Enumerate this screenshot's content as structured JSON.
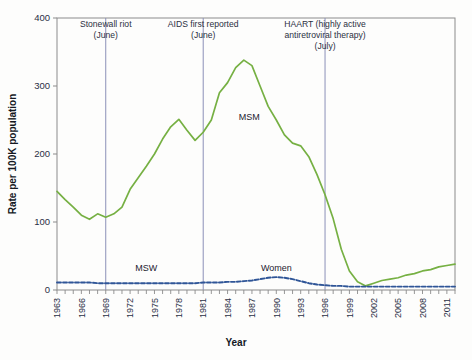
{
  "chart_data": {
    "type": "line",
    "title": "",
    "xlabel": "Year",
    "ylabel": "Rate per 100K population",
    "xlim": [
      1963,
      2012
    ],
    "ylim": [
      0,
      400
    ],
    "yticks": [
      0,
      100,
      200,
      300,
      400
    ],
    "xticks": [
      1963,
      1966,
      1969,
      1972,
      1975,
      1978,
      1981,
      1984,
      1987,
      1990,
      1993,
      1996,
      1999,
      2002,
      2005,
      2008,
      2011
    ],
    "xtick_all_years": [
      1963,
      1964,
      1965,
      1966,
      1967,
      1968,
      1969,
      1970,
      1971,
      1972,
      1973,
      1974,
      1975,
      1976,
      1977,
      1978,
      1979,
      1980,
      1981,
      1982,
      1983,
      1984,
      1985,
      1986,
      1987,
      1988,
      1989,
      1990,
      1991,
      1992,
      1993,
      1994,
      1995,
      1996,
      1997,
      1998,
      1999,
      2000,
      2001,
      2002,
      2003,
      2004,
      2005,
      2006,
      2007,
      2008,
      2009,
      2010,
      2011,
      2012
    ],
    "grid": false,
    "legend_position": "inline-annotations",
    "series": [
      {
        "name": "MSM",
        "color": "#76b043",
        "style": "solid",
        "label_x": 1985,
        "label_y": 250,
        "x": [
          1963,
          1964,
          1965,
          1966,
          1967,
          1968,
          1969,
          1970,
          1971,
          1972,
          1973,
          1974,
          1975,
          1976,
          1977,
          1978,
          1979,
          1980,
          1981,
          1982,
          1983,
          1984,
          1985,
          1986,
          1987,
          1988,
          1989,
          1990,
          1991,
          1992,
          1993,
          1994,
          1995,
          1996,
          1997,
          1998,
          1999,
          2000,
          2001,
          2002,
          2003,
          2004,
          2005,
          2006,
          2007,
          2008,
          2009,
          2010,
          2011,
          2012
        ],
        "values": [
          145,
          133,
          122,
          110,
          104,
          112,
          107,
          112,
          122,
          148,
          165,
          182,
          200,
          222,
          240,
          251,
          235,
          220,
          232,
          250,
          290,
          305,
          327,
          338,
          330,
          300,
          270,
          250,
          228,
          216,
          212,
          196,
          170,
          140,
          105,
          60,
          28,
          12,
          6,
          10,
          14,
          16,
          18,
          22,
          24,
          28,
          30,
          34,
          36,
          38
        ]
      },
      {
        "name": "MSW",
        "color": "#2f5597",
        "style": "dashed",
        "label_x": 1974,
        "label_y": 28,
        "x": [
          1963,
          1964,
          1965,
          1966,
          1967,
          1968,
          1969,
          1970,
          1971,
          1972,
          1973,
          1974,
          1975,
          1976,
          1977,
          1978,
          1979,
          1980,
          1981,
          1982,
          1983,
          1984,
          1985,
          1986,
          1987,
          1988,
          1989,
          1990,
          1991,
          1992,
          1993,
          1994,
          1995,
          1996,
          1997,
          1998,
          1999,
          2000,
          2001,
          2002,
          2003,
          2004,
          2005,
          2006,
          2007,
          2008,
          2009,
          2010,
          2011,
          2012
        ],
        "values": [
          11,
          11,
          11,
          11,
          11,
          10,
          10,
          10,
          10,
          10,
          10,
          10,
          10,
          10,
          10,
          10,
          10,
          10,
          11,
          11,
          11,
          12,
          12,
          13,
          14,
          16,
          18,
          19,
          18,
          16,
          13,
          10,
          8,
          7,
          6,
          6,
          5,
          5,
          5,
          5,
          5,
          5,
          5,
          5,
          5,
          5,
          5,
          5,
          5,
          5
        ]
      }
    ],
    "annotations": [
      {
        "label_lines": [
          "Stonewall riot",
          "(June)"
        ],
        "year": 1969,
        "line_top": 400,
        "line_bottom": 0
      },
      {
        "label_lines": [
          "AIDS first reported",
          "(June)"
        ],
        "year": 1981,
        "line_top": 400,
        "line_bottom": 0
      },
      {
        "label_lines": [
          "HAART (highly active",
          "antiretroviral therapy)",
          "(July)"
        ],
        "year": 1996,
        "line_top": 400,
        "line_bottom": 0
      }
    ],
    "series_inline_labels": [
      {
        "text": "MSM"
      },
      {
        "text": "MSW"
      },
      {
        "text": "Women"
      }
    ],
    "colors": {
      "msm_line": "#76b043",
      "msw_line": "#2f5597",
      "annotation_line": "#8b90b8",
      "axis": "#8b8b8b",
      "text": "#2a2f45"
    }
  }
}
